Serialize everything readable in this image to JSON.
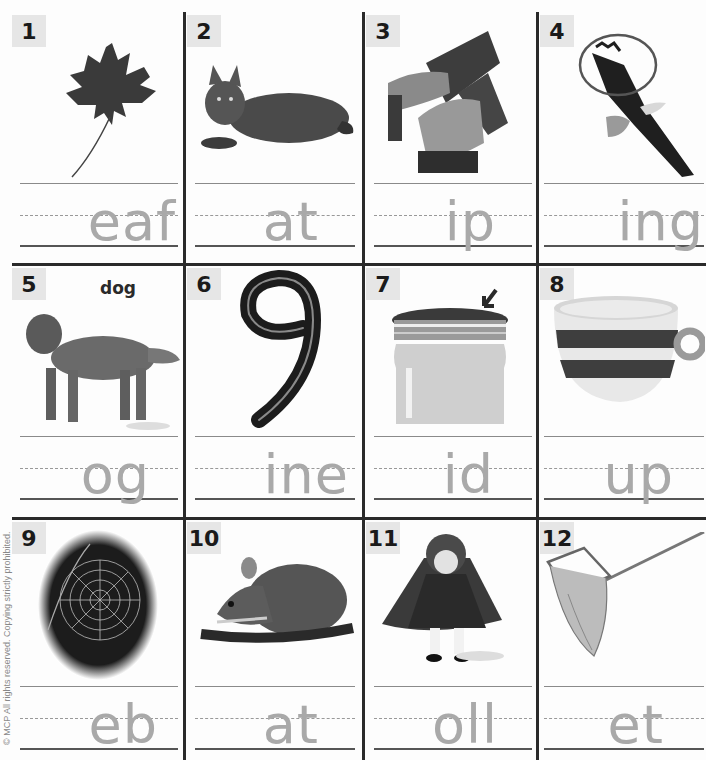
{
  "worksheet": {
    "copyright": "© MCP All rights reserved. Copying strictly prohibited.",
    "items": [
      {
        "number": "1",
        "picture": "maple-leaf",
        "letters": "eaf",
        "caption": ""
      },
      {
        "number": "2",
        "picture": "cat",
        "letters": "at",
        "caption": ""
      },
      {
        "number": "3",
        "picture": "hands-ripping-paper",
        "letters": "ip",
        "caption": ""
      },
      {
        "number": "4",
        "picture": "eagle-wing-circled",
        "letters": "ing",
        "caption": ""
      },
      {
        "number": "5",
        "picture": "dog",
        "letters": "og",
        "caption": "dog"
      },
      {
        "number": "6",
        "picture": "number-nine",
        "letters": "ine",
        "caption": ""
      },
      {
        "number": "7",
        "picture": "jar-lid-arrow",
        "letters": "id",
        "caption": ""
      },
      {
        "number": "8",
        "picture": "striped-cup",
        "letters": "up",
        "caption": ""
      },
      {
        "number": "9",
        "picture": "spider-web",
        "letters": "eb",
        "caption": ""
      },
      {
        "number": "10",
        "picture": "rat",
        "letters": "at",
        "caption": ""
      },
      {
        "number": "11",
        "picture": "doll",
        "letters": "oll",
        "caption": ""
      },
      {
        "number": "12",
        "picture": "fishing-net",
        "letters": "et",
        "caption": ""
      }
    ]
  },
  "colors": {
    "grid": "#2a2a2a",
    "badge": "#e6e6e6",
    "traced_letters": "#a9a9a9"
  }
}
